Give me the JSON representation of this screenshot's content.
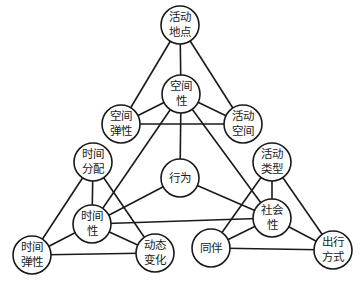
{
  "diagram": {
    "type": "concept-network",
    "colors": {
      "line": "#1a1a1a",
      "node_fill": "#ffffff",
      "text": "#222222"
    },
    "nodes": [
      {
        "id": "activity-location",
        "label": "活动\n地点",
        "x": 180,
        "y": 25,
        "r": 19
      },
      {
        "id": "spatiality",
        "label": "空间\n性",
        "x": 181,
        "y": 94,
        "r": 19
      },
      {
        "id": "spatial-flexibility",
        "label": "空间\n弹性",
        "x": 121,
        "y": 124,
        "r": 19
      },
      {
        "id": "activity-space",
        "label": "活动\n空间",
        "x": 243,
        "y": 124,
        "r": 19
      },
      {
        "id": "time-allocation",
        "label": "时间\n分配",
        "x": 93,
        "y": 162,
        "r": 19
      },
      {
        "id": "behavior",
        "label": "行为",
        "x": 180,
        "y": 178,
        "r": 19
      },
      {
        "id": "activity-type",
        "label": "活动\n类型",
        "x": 272,
        "y": 162,
        "r": 19
      },
      {
        "id": "temporality",
        "label": "时间\n性",
        "x": 92,
        "y": 224,
        "r": 19
      },
      {
        "id": "sociality",
        "label": "社会\n性",
        "x": 272,
        "y": 218,
        "r": 19
      },
      {
        "id": "time-flexibility",
        "label": "时间\n弹性",
        "x": 32,
        "y": 255,
        "r": 19
      },
      {
        "id": "dynamic-change",
        "label": "动态\n变化",
        "x": 155,
        "y": 253,
        "r": 19
      },
      {
        "id": "companion",
        "label": "同伴",
        "x": 211,
        "y": 248,
        "r": 19
      },
      {
        "id": "travel-mode",
        "label": "出行\n方式",
        "x": 333,
        "y": 250,
        "r": 19
      }
    ],
    "edges": [
      [
        "activity-location",
        "spatiality"
      ],
      [
        "activity-location",
        "spatial-flexibility"
      ],
      [
        "activity-location",
        "activity-space"
      ],
      [
        "spatiality",
        "spatial-flexibility"
      ],
      [
        "spatiality",
        "activity-space"
      ],
      [
        "spatial-flexibility",
        "activity-space"
      ],
      [
        "time-allocation",
        "temporality"
      ],
      [
        "time-allocation",
        "time-flexibility"
      ],
      [
        "time-allocation",
        "dynamic-change"
      ],
      [
        "temporality",
        "time-flexibility"
      ],
      [
        "temporality",
        "dynamic-change"
      ],
      [
        "time-flexibility",
        "dynamic-change"
      ],
      [
        "activity-type",
        "sociality"
      ],
      [
        "activity-type",
        "companion"
      ],
      [
        "activity-type",
        "travel-mode"
      ],
      [
        "sociality",
        "companion"
      ],
      [
        "sociality",
        "travel-mode"
      ],
      [
        "companion",
        "travel-mode"
      ],
      [
        "spatiality",
        "temporality"
      ],
      [
        "spatiality",
        "sociality"
      ],
      [
        "temporality",
        "sociality"
      ],
      [
        "behavior",
        "spatiality"
      ],
      [
        "behavior",
        "temporality"
      ],
      [
        "behavior",
        "sociality"
      ]
    ]
  }
}
